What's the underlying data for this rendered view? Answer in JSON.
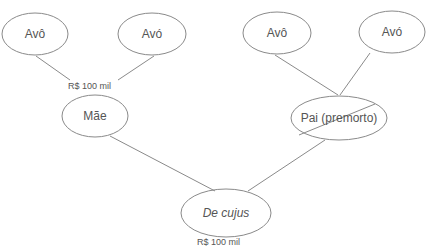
{
  "diagram": {
    "type": "family-tree",
    "nodes": {
      "grandfather_maternal": {
        "label": "Avô"
      },
      "grandmother_maternal": {
        "label": "Avó"
      },
      "grandfather_paternal": {
        "label": "Avô"
      },
      "grandmother_paternal": {
        "label": "Avó"
      },
      "mother": {
        "label": "Mãe"
      },
      "father": {
        "label": "Pai (premorto)",
        "crossed_out": true
      },
      "deceased": {
        "label": "De cujus"
      }
    },
    "amounts": {
      "maternal_grandparents": "R$ 100 mil",
      "deceased": "R$ 100 mil"
    },
    "colors": {
      "stroke": "#888888",
      "text": "#555555"
    }
  }
}
